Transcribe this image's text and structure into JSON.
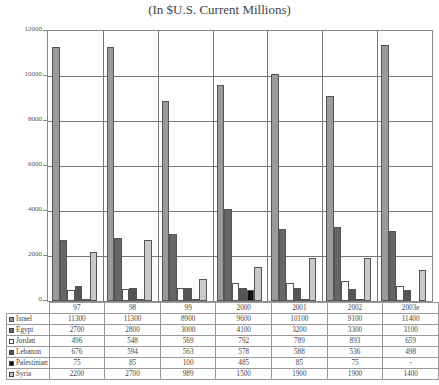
{
  "title": "(In $U.S. Current Millions)",
  "chart_data": {
    "type": "bar",
    "title": "(In $U.S. Current Millions)",
    "xlabel": "",
    "ylabel": "",
    "ylim": [
      0,
      12000
    ],
    "yticks": [
      0,
      2000,
      4000,
      6000,
      8000,
      10000,
      12000
    ],
    "grid": true,
    "legend_position": "data-table-below",
    "categories": [
      "97",
      "98",
      "99",
      "2000",
      "2001",
      "2002",
      "2003e"
    ],
    "series": [
      {
        "name": "Israel",
        "color": "#9a9a9a",
        "values": [
          11300,
          11300,
          8900,
          9600,
          10100,
          9100,
          11400
        ],
        "labels": [
          "11300",
          "11300",
          "8900",
          "9600",
          "10100",
          "9100",
          "11400"
        ]
      },
      {
        "name": "Egypt",
        "color": "#666666",
        "values": [
          2700,
          2800,
          3000,
          4100,
          3200,
          3300,
          3100
        ],
        "labels": [
          "2700",
          "2800",
          "3000",
          "4100",
          "3200",
          "3300",
          "3100"
        ]
      },
      {
        "name": "Jordan",
        "color": "#ffffff",
        "values": [
          496,
          548,
          569,
          792,
          789,
          893,
          659
        ],
        "labels": [
          "496",
          "548",
          "569",
          "792",
          "789",
          "893",
          "659"
        ]
      },
      {
        "name": "Lebanon",
        "color": "#555555",
        "values": [
          676,
          594,
          563,
          578,
          588,
          536,
          498
        ],
        "labels": [
          "676",
          "594",
          "563",
          "578",
          "588",
          "536",
          "498"
        ]
      },
      {
        "name": "Palestinian",
        "color": "#111111",
        "values": [
          75,
          85,
          100,
          485,
          85,
          75,
          0
        ],
        "labels": [
          "75",
          "85",
          "100",
          "485",
          "85",
          "75",
          "-"
        ]
      },
      {
        "name": "Syria",
        "color": "#c9c9c9",
        "values": [
          2200,
          2700,
          989,
          1500,
          1900,
          1900,
          1400
        ],
        "labels": [
          "2200",
          "2700",
          "989",
          "1500",
          "1900",
          "1900",
          "1400"
        ]
      }
    ]
  }
}
